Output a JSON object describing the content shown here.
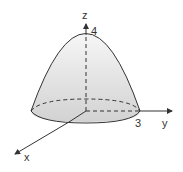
{
  "diagram": {
    "type": "3d-paraboloid",
    "axes": {
      "z": {
        "label": "z"
      },
      "y": {
        "label": "y"
      },
      "x": {
        "label": "x"
      }
    },
    "annotations": {
      "apex_value": "4",
      "radius_value": "3"
    },
    "colors": {
      "stroke": "#333333",
      "fill_top": "#f4f4f4",
      "fill_bottom": "#cfcfcf"
    }
  }
}
